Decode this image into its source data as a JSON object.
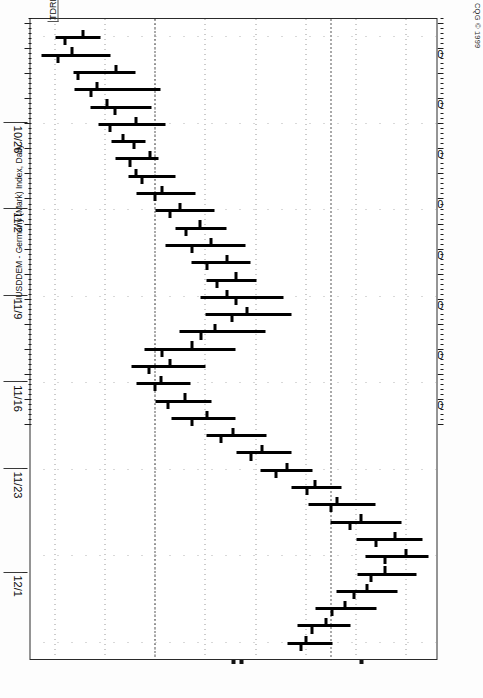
{
  "meta": {
    "vendor": "CQG © 1999",
    "symbol_label": "IUSDDEM - Germany (Mark) Index, Daily",
    "corner_tag": "TDREB",
    "orientation": "rotated-90-cw",
    "page_width": 483,
    "page_height": 698
  },
  "chart_data": {
    "type": "ohlc",
    "title": "IUSDDEM - Germany (Mark) Index, Daily",
    "xlabel": "",
    "ylabel": "",
    "grid": true,
    "legend": "none",
    "ylim": [
      16350,
      17160
    ],
    "ytick_labels": [
      "17100",
      "17000",
      "16900",
      "16800",
      "16700",
      "16600",
      "16500",
      "16400"
    ],
    "ytick_values": [
      17100,
      17000,
      16900,
      16800,
      16700,
      16600,
      16500,
      16400
    ],
    "xtick_labels": [
      "10/26",
      "11/2",
      "11/9",
      "11/16",
      "11/23",
      "12/1"
    ],
    "reference_lines": [
      16600,
      16950
    ],
    "bars": [
      {
        "date": "10/21",
        "open": 16455,
        "high": 16490,
        "low": 16400,
        "close": 16418
      },
      {
        "date": "10/22",
        "open": 16432,
        "high": 16510,
        "low": 16372,
        "close": 16405
      },
      {
        "date": "10/25",
        "open": 16520,
        "high": 16560,
        "low": 16435,
        "close": 16445
      },
      {
        "date": "10/26",
        "open": 16482,
        "high": 16610,
        "low": 16438,
        "close": 16470
      },
      {
        "date": "10/27",
        "open": 16502,
        "high": 16592,
        "low": 16470,
        "close": 16518
      },
      {
        "date": "10/28",
        "open": 16560,
        "high": 16620,
        "low": 16485,
        "close": 16508
      },
      {
        "date": "10/29",
        "open": 16535,
        "high": 16580,
        "low": 16512,
        "close": 16556
      },
      {
        "date": "11/1",
        "open": 16588,
        "high": 16605,
        "low": 16520,
        "close": 16548
      },
      {
        "date": "11/2",
        "open": 16560,
        "high": 16640,
        "low": 16545,
        "close": 16572
      },
      {
        "date": "11/3",
        "open": 16612,
        "high": 16680,
        "low": 16562,
        "close": 16598
      },
      {
        "date": "11/4",
        "open": 16648,
        "high": 16718,
        "low": 16600,
        "close": 16628
      },
      {
        "date": "11/5",
        "open": 16688,
        "high": 16742,
        "low": 16640,
        "close": 16660
      },
      {
        "date": "11/8",
        "open": 16710,
        "high": 16780,
        "low": 16620,
        "close": 16672
      },
      {
        "date": "11/9",
        "open": 16742,
        "high": 16790,
        "low": 16672,
        "close": 16702
      },
      {
        "date": "11/10",
        "open": 16760,
        "high": 16800,
        "low": 16700,
        "close": 16722
      },
      {
        "date": "11/11",
        "open": 16742,
        "high": 16855,
        "low": 16690,
        "close": 16760
      },
      {
        "date": "11/12",
        "open": 16782,
        "high": 16870,
        "low": 16700,
        "close": 16752
      },
      {
        "date": "11/15",
        "open": 16718,
        "high": 16818,
        "low": 16648,
        "close": 16690
      },
      {
        "date": "11/16",
        "open": 16672,
        "high": 16760,
        "low": 16578,
        "close": 16612
      },
      {
        "date": "11/17",
        "open": 16628,
        "high": 16700,
        "low": 16552,
        "close": 16586
      },
      {
        "date": "11/18",
        "open": 16610,
        "high": 16670,
        "low": 16562,
        "close": 16598
      },
      {
        "date": "11/19",
        "open": 16658,
        "high": 16712,
        "low": 16600,
        "close": 16624
      },
      {
        "date": "11/22",
        "open": 16702,
        "high": 16760,
        "low": 16632,
        "close": 16672
      },
      {
        "date": "11/23",
        "open": 16755,
        "high": 16820,
        "low": 16700,
        "close": 16730
      },
      {
        "date": "11/24",
        "open": 16812,
        "high": 16870,
        "low": 16760,
        "close": 16790
      },
      {
        "date": "11/25",
        "open": 16862,
        "high": 16912,
        "low": 16808,
        "close": 16840
      },
      {
        "date": "11/26",
        "open": 16918,
        "high": 16970,
        "low": 16870,
        "close": 16902
      },
      {
        "date": "11/29",
        "open": 16962,
        "high": 17038,
        "low": 16905,
        "close": 16950
      },
      {
        "date": "11/30",
        "open": 17010,
        "high": 17090,
        "low": 16948,
        "close": 16988
      },
      {
        "date": "12/1",
        "open": 17078,
        "high": 17132,
        "low": 17000,
        "close": 17040
      },
      {
        "date": "12/2",
        "open": 17100,
        "high": 17145,
        "low": 17018,
        "close": 17058
      },
      {
        "date": "12/3",
        "open": 17058,
        "high": 17120,
        "low": 17002,
        "close": 17030
      },
      {
        "date": "12/6",
        "open": 17022,
        "high": 17082,
        "low": 16960,
        "close": 16995
      },
      {
        "date": "12/7",
        "open": 16978,
        "high": 17040,
        "low": 16918,
        "close": 16952
      },
      {
        "date": "12/8",
        "open": 16940,
        "high": 16988,
        "low": 16882,
        "close": 16912
      },
      {
        "date": "12/9",
        "open": 16900,
        "high": 16952,
        "low": 16862,
        "close": 16890
      }
    ]
  }
}
